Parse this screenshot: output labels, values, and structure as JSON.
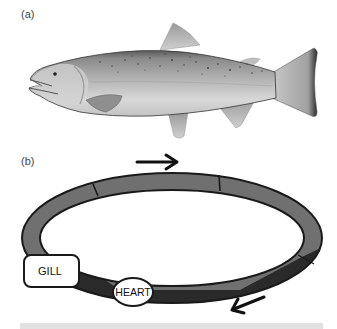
{
  "panels": {
    "a": {
      "label": "(a)",
      "subject": "salmon-illustration"
    },
    "b": {
      "label": "(b)",
      "subject": "circulatory-loop-diagram",
      "nodes": {
        "gill": {
          "label": "GILL"
        },
        "heart": {
          "label": "HEART"
        }
      },
      "flow_arrows": [
        {
          "name": "top-arrow",
          "direction": "right"
        },
        {
          "name": "bottom-arrow",
          "direction": "left"
        }
      ],
      "segments": [
        {
          "name": "segment-top-left",
          "color": "#707070"
        },
        {
          "name": "segment-top-middle",
          "color": "#707070"
        },
        {
          "name": "segment-top-right",
          "color": "#707070"
        },
        {
          "name": "segment-venous-bottom",
          "color": "#2a2a2a"
        }
      ]
    }
  },
  "colors": {
    "outline": "#1a1a1a",
    "oxygenated": "#707070",
    "deoxygenated": "#2a2a2a",
    "fish_body": "#b8b8b8",
    "fish_belly": "#e4e4e4",
    "fish_back": "#6e6e6e",
    "bottom_bar": "#e2e2e2"
  }
}
